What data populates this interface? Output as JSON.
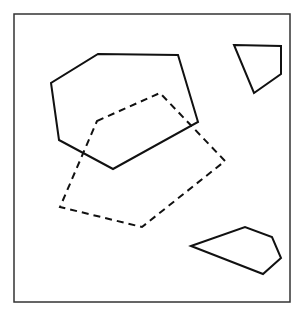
{
  "diagram": {
    "stroke_color": "#111111",
    "background": "#ffffff",
    "shapes": [
      {
        "id": "solid-hexagon",
        "style": "solid",
        "sides": 6,
        "points": [
          [
            98,
            54
          ],
          [
            178,
            55
          ],
          [
            198,
            122
          ],
          [
            113,
            169
          ],
          [
            59,
            140
          ],
          [
            51,
            83
          ]
        ]
      },
      {
        "id": "dashed-pentagon",
        "style": "dashed",
        "sides": 5,
        "points": [
          [
            97,
            121
          ],
          [
            160,
            93
          ],
          [
            225,
            161
          ],
          [
            142,
            227
          ],
          [
            60,
            207
          ]
        ]
      },
      {
        "id": "solid-quadrilateral",
        "style": "solid",
        "sides": 4,
        "points": [
          [
            234,
            45
          ],
          [
            281,
            46
          ],
          [
            281,
            74
          ],
          [
            254,
            93
          ]
        ]
      },
      {
        "id": "solid-pentagon-small",
        "style": "solid",
        "sides": 5,
        "points": [
          [
            191,
            246
          ],
          [
            245,
            227
          ],
          [
            272,
            237
          ],
          [
            281,
            258
          ],
          [
            263,
            274
          ]
        ]
      }
    ]
  }
}
